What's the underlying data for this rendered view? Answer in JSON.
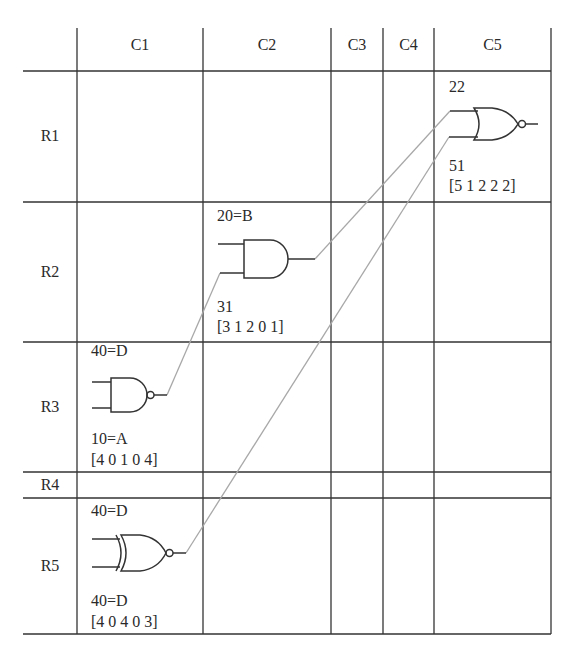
{
  "grid": {
    "column_headers": [
      "C1",
      "C2",
      "C3",
      "C4",
      "C5"
    ],
    "row_headers": [
      "R1",
      "R2",
      "R3",
      "R4",
      "R5"
    ]
  },
  "gates": [
    {
      "id": "nor-gate",
      "type": "NOR",
      "cell": "R1C5",
      "top_label": "22",
      "bottom_label": "51",
      "vector": "[5 1 2 2 2]"
    },
    {
      "id": "and-gate",
      "type": "AND",
      "cell": "R2C2",
      "top_label": "20=B",
      "bottom_label": "31",
      "vector": "[3 1 2 0 1]"
    },
    {
      "id": "nand-gate",
      "type": "NAND",
      "cell": "R3C1",
      "top_label": "40=D",
      "bottom_label": "10=A",
      "vector": "[4 0 1 0 4]"
    },
    {
      "id": "xnor-gate",
      "type": "XNOR",
      "cell": "R5C1",
      "top_label": "40=D",
      "bottom_label": "40=D",
      "vector": "[4 0 4 0 3]"
    }
  ],
  "connections": [
    {
      "from": "nand-gate.output",
      "to": "and-gate.input2"
    },
    {
      "from": "and-gate.output",
      "to": "nor-gate.input1"
    },
    {
      "from": "xnor-gate.output",
      "to": "nor-gate.input2"
    }
  ],
  "colors": {
    "grid_line": "#333333",
    "gate_stroke": "#333333",
    "wire": "#a8a8a8",
    "text": "#2a2a2a"
  }
}
